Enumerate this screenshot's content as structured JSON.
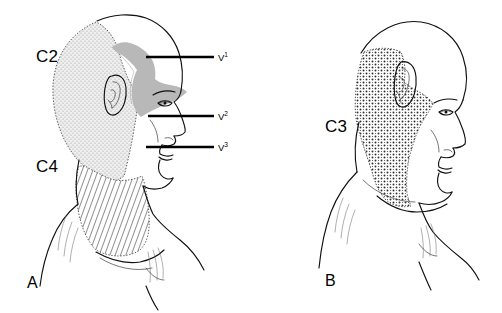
{
  "figure": {
    "background_color": "#ffffff",
    "ink_color": "#111111",
    "band_color": "#b8b8b8"
  },
  "panels": [
    {
      "letter": "A",
      "name": "panel-a",
      "description": "Lateral view of head and neck showing C2, C4 and trigeminal divisions",
      "labels": [
        {
          "text": "C2",
          "name": "label-c2",
          "x": 36,
          "y": 62,
          "pattern": "fine-stipple"
        },
        {
          "text": "C4",
          "name": "label-c4",
          "x": 36,
          "y": 172,
          "pattern": "diagonal-hatch"
        }
      ],
      "callouts": [
        {
          "base": "V",
          "sup": "1",
          "name": "callout-v1",
          "label_x": 218,
          "label_y": 61,
          "leader_x1": 146,
          "leader_x2": 214,
          "leader_y": 57
        },
        {
          "base": "V",
          "sup": "2",
          "name": "callout-v2",
          "label_x": 218,
          "label_y": 120,
          "leader_x1": 148,
          "leader_x2": 214,
          "leader_y": 116
        },
        {
          "base": "V",
          "sup": "3",
          "name": "callout-v3",
          "label_x": 218,
          "label_y": 151,
          "leader_x1": 146,
          "leader_x2": 214,
          "leader_y": 147
        }
      ]
    },
    {
      "letter": "B",
      "name": "panel-b",
      "description": "Lateral view of head and neck showing the C3 dermatome",
      "labels": [
        {
          "text": "C3",
          "name": "label-c3",
          "x": 74,
          "y": 132,
          "pattern": "coarse-stipple"
        }
      ],
      "callouts": []
    }
  ],
  "panel_letters": [
    {
      "text": "A",
      "name": "panel-letter-a",
      "x": 27,
      "y": 288
    },
    {
      "text": "B",
      "name": "panel-letter-b",
      "x": 74,
      "y": 286
    }
  ],
  "legend_regions": [
    {
      "name": "region-c2",
      "label": "C2",
      "fill_pattern": "fine-stipple",
      "panel": "A"
    },
    {
      "name": "region-c4",
      "label": "C4",
      "fill_pattern": "diagonal-hatch",
      "panel": "A"
    },
    {
      "name": "region-v2-band",
      "label": "V2",
      "fill_pattern": "solid-gray",
      "panel": "A"
    },
    {
      "name": "region-c3",
      "label": "C3",
      "fill_pattern": "coarse-stipple",
      "panel": "B"
    }
  ]
}
